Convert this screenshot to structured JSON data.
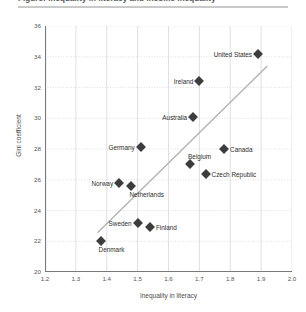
{
  "title": "Figure: Inequality in literacy and income inequality",
  "axes": {
    "xlabel": "Inequality in literacy",
    "ylabel": "Gini coefficient",
    "yticks": [
      "36",
      "34",
      "32",
      "30",
      "28",
      "26",
      "24",
      "22",
      "20"
    ],
    "xticks": [
      "1.2",
      "1.3",
      "1.4",
      "1.5",
      "1.6",
      "1.7",
      "1.8",
      "1.9",
      "2.0"
    ]
  },
  "colors": {
    "marker": "#3d3d3d",
    "trendline": "#b4b4b4",
    "grid": "#d8d8d8",
    "axis": "#777777",
    "text": "#3a3a3a"
  },
  "chart_data": {
    "type": "scatter",
    "title": "Figure: Inequality in literacy and income inequality",
    "xlabel": "Inequality in literacy",
    "ylabel": "Gini coefficient",
    "xlim": [
      1.2,
      2.0
    ],
    "ylim": [
      20,
      36
    ],
    "grid": true,
    "legend": "none",
    "trendline": {
      "visible": true,
      "x": [
        1.37,
        1.92
      ],
      "y": [
        22.55,
        33.4
      ]
    },
    "points": [
      {
        "label": "United States",
        "x": 1.89,
        "y": 34.2,
        "label_pos": "left"
      },
      {
        "label": "Ireland",
        "x": 1.7,
        "y": 32.4,
        "label_pos": "left"
      },
      {
        "label": "Australia",
        "x": 1.68,
        "y": 30.1,
        "label_pos": "left"
      },
      {
        "label": "Germany",
        "x": 1.51,
        "y": 28.1,
        "label_pos": "left"
      },
      {
        "label": "Canada",
        "x": 1.78,
        "y": 28.0,
        "label_pos": "right"
      },
      {
        "label": "Belgium",
        "x": 1.67,
        "y": 27.0,
        "label_pos": "above"
      },
      {
        "label": "Czech Republic",
        "x": 1.72,
        "y": 26.4,
        "label_pos": "right"
      },
      {
        "label": "Norway",
        "x": 1.44,
        "y": 25.8,
        "label_pos": "left"
      },
      {
        "label": "Netherlands",
        "x": 1.48,
        "y": 25.6,
        "label_pos": "below-right"
      },
      {
        "label": "Sweden",
        "x": 1.5,
        "y": 23.2,
        "label_pos": "left"
      },
      {
        "label": "Finland",
        "x": 1.54,
        "y": 22.9,
        "label_pos": "right"
      },
      {
        "label": "Denmark",
        "x": 1.38,
        "y": 22.0,
        "label_pos": "below-right"
      }
    ]
  }
}
